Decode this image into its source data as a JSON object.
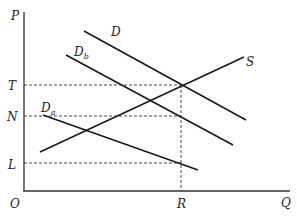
{
  "diagram": {
    "type": "supply-demand",
    "axes": {
      "y_label": "P",
      "x_label": "Q",
      "origin_label": "O"
    },
    "price_levels": [
      {
        "label": "T",
        "y": 85
      },
      {
        "label": "N",
        "y": 116
      },
      {
        "label": "L",
        "y": 163
      }
    ],
    "quantity_levels": [
      {
        "label": "R",
        "x": 181
      }
    ],
    "curves": {
      "D": {
        "label": "D",
        "sub": ""
      },
      "Db": {
        "label": "D",
        "sub": "b"
      },
      "Da": {
        "label": "D",
        "sub": "a"
      },
      "S": {
        "label": "S",
        "sub": ""
      }
    },
    "colors": {
      "line": "#1a1a1a",
      "background": "#ffffff"
    }
  }
}
